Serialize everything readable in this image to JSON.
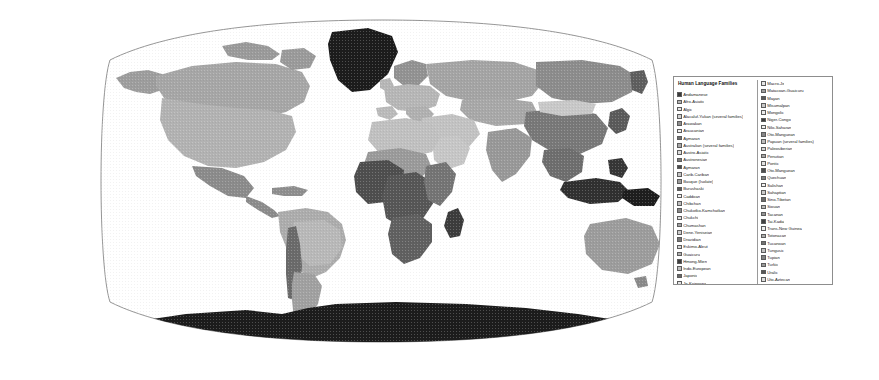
{
  "map": {
    "projection": "robinson",
    "title_visible": false,
    "background_color": "#ffffff",
    "outline_color": "#8a8a8a",
    "antarctica_color": "#1c1c1c",
    "greenland_color": "#1c1c1c",
    "ocean_color": "#ffffff"
  },
  "legend": {
    "title": "Human Language Families",
    "columns": [
      {
        "items": [
          {
            "label": "Andamanese",
            "color": "#3a3a3a"
          },
          {
            "label": "Afro-Asiatic",
            "color": "#b4b4b4"
          },
          {
            "label": "Algic",
            "color": "#e8e8e8"
          },
          {
            "label": "Alacaluf-Yukan (several families)",
            "color": "#d2d2d2"
          },
          {
            "label": "Arawakan",
            "color": "#8e8e8e"
          },
          {
            "label": "Araucanian",
            "color": "#f0f0f0"
          },
          {
            "label": "Aymaran",
            "color": "#6e6e6e"
          },
          {
            "label": "Australian (several families)",
            "color": "#a8a8a8"
          },
          {
            "label": "Austro-Asiatic",
            "color": "#dcdcdc"
          },
          {
            "label": "Austronesian",
            "color": "#7a7a7a"
          },
          {
            "label": "Aymaran",
            "color": "#4a4a4a"
          },
          {
            "label": "Carib-Cariban",
            "color": "#c6c6c6"
          },
          {
            "label": "Basque (Isolate)",
            "color": "#9c9c9c"
          },
          {
            "label": "Burushaski",
            "color": "#5c5c5c"
          },
          {
            "label": "Caddoan",
            "color": "#f2f2f2"
          },
          {
            "label": "Chibchan",
            "color": "#bebebe"
          },
          {
            "label": "Chukotko-Kamchatkan",
            "color": "#888888"
          },
          {
            "label": "Chukchi",
            "color": "#e0e0e0"
          },
          {
            "label": "Chumashan",
            "color": "#a2a2a2"
          },
          {
            "label": "Dene-Yeniseian",
            "color": "#cccccc"
          },
          {
            "label": "Dravidian",
            "color": "#767676"
          },
          {
            "label": "Eskimo-Aleut",
            "color": "#d8d8d8"
          },
          {
            "label": "Guaicuru",
            "color": "#b0b0b0"
          },
          {
            "label": "Hmong-Mien",
            "color": "#3e3e3e"
          },
          {
            "label": "Indo-European",
            "color": "#c0c0c0"
          },
          {
            "label": "Japonic",
            "color": "#666666"
          },
          {
            "label": "Je-Kaingang",
            "color": "#e4e4e4"
          },
          {
            "label": "Kartvelian",
            "color": "#989898"
          },
          {
            "label": "Khoisan",
            "color": "#d4d4d4"
          },
          {
            "label": "Khoe-Kwadi",
            "color": "#ababab"
          }
        ]
      },
      {
        "items": [
          {
            "label": "Macro-Je",
            "color": "#e6e6e6"
          },
          {
            "label": "Matacoan-Guaicuru",
            "color": "#9e9e9e"
          },
          {
            "label": "Mayan",
            "color": "#5a5a5a"
          },
          {
            "label": "Misumalpan",
            "color": "#c8c8c8"
          },
          {
            "label": "Mongolic",
            "color": "#ececec"
          },
          {
            "label": "Niger-Congo",
            "color": "#3c3c3c"
          },
          {
            "label": "Nilo-Saharan",
            "color": "#f0f0f0"
          },
          {
            "label": "Oto-Manguean",
            "color": "#868686"
          },
          {
            "label": "Papuan (several families)",
            "color": "#bcbcbc"
          },
          {
            "label": "Paleosiberian",
            "color": "#d6d6d6"
          },
          {
            "label": "Penutian",
            "color": "#a6a6a6"
          },
          {
            "label": "Pontic",
            "color": "#e2e2e2"
          },
          {
            "label": "Oto-Manguean",
            "color": "#4e4e4e"
          },
          {
            "label": "Quechuan",
            "color": "#7e7e7e"
          },
          {
            "label": "Salishan",
            "color": "#f4f4f4"
          },
          {
            "label": "Sahaptian",
            "color": "#cacaca"
          },
          {
            "label": "Sino-Tibetan",
            "color": "#6a6a6a"
          },
          {
            "label": "Siouan",
            "color": "#b8b8b8"
          },
          {
            "label": "Tacanan",
            "color": "#949494"
          },
          {
            "label": "Tai-Kadai",
            "color": "#424242"
          },
          {
            "label": "Trans-New Guinea",
            "color": "#eeeeee"
          },
          {
            "label": "Totonacan",
            "color": "#aeaeae"
          },
          {
            "label": "Tucanoan",
            "color": "#727272"
          },
          {
            "label": "Tungusic",
            "color": "#c2c2c2"
          },
          {
            "label": "Tupian",
            "color": "#828282"
          },
          {
            "label": "Turkic",
            "color": "#9a9a9a"
          },
          {
            "label": "Uralic",
            "color": "#565656"
          },
          {
            "label": "Uto-Aztecan",
            "color": "#dedede"
          },
          {
            "label": "Witotoan",
            "color": "#d0d0d0"
          },
          {
            "label": "Yanomamic",
            "color": "#f6f6f6"
          },
          {
            "label": "Yeniseic",
            "color": "#626262"
          },
          {
            "label": "Zamucoan",
            "color": "#909090"
          }
        ]
      }
    ]
  }
}
